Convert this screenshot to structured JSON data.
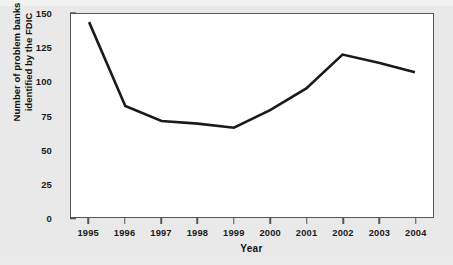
{
  "chart_data": {
    "type": "line",
    "title": "",
    "subtitle": "",
    "xlabel": "Year",
    "ylabel": "Number of problem banks identified by the FDIC",
    "ylabel_line1": "Number of problem banks",
    "ylabel_line2": "identified by the FDIC",
    "categories": [
      "1995",
      "1996",
      "1997",
      "1998",
      "1999",
      "2000",
      "2001",
      "2002",
      "2003",
      "2004"
    ],
    "x": [
      1995,
      1996,
      1997,
      1998,
      1999,
      2000,
      2001,
      2002,
      2003,
      2004
    ],
    "values": [
      144,
      82,
      71,
      69,
      66,
      79,
      95,
      120,
      114,
      107
    ],
    "series": [
      {
        "name": "Number of problem banks identified by the FDIC",
        "values": [
          144,
          82,
          71,
          69,
          66,
          79,
          95,
          120,
          114,
          107
        ],
        "color": "#1a1a1a",
        "line_width": 2.6
      }
    ],
    "ylim": [
      0,
      150
    ],
    "yticks": [
      0,
      25,
      50,
      75,
      100,
      125,
      150
    ],
    "ytick_labels": [
      "0",
      "25",
      "50",
      "75",
      "100",
      "125",
      "150"
    ],
    "xlim": [
      1994.5,
      2004.5
    ],
    "xticks": [
      1995,
      1996,
      1997,
      1998,
      1999,
      2000,
      2001,
      2002,
      2003,
      2004
    ],
    "xtick_labels": [
      "1995",
      "1996",
      "1997",
      "1998",
      "1999",
      "2000",
      "2001",
      "2002",
      "2003",
      "2004"
    ],
    "grid": false,
    "legend": false,
    "legend_position": "none",
    "annotations": [],
    "colors": {
      "line": "#1a1a1a",
      "frame": "#55565a",
      "plot_background": "#ffffff",
      "figure_background": "#e9e9e9",
      "text": "#111111"
    }
  }
}
